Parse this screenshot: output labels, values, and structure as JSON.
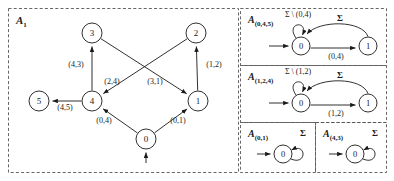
{
  "figure": {
    "background": "#ffffff",
    "stroke": "#1a1a1a",
    "dash_color": "#555555"
  },
  "panels": [
    {
      "id": "main",
      "label_base": "A",
      "label_sub": "1",
      "x": 8,
      "y": 8,
      "w": 230,
      "h": 164
    },
    {
      "id": "a045",
      "label_base": "A",
      "label_sub": "(0,4,5)",
      "x": 240,
      "y": 8,
      "w": 146,
      "h": 57
    },
    {
      "id": "a124",
      "label_base": "A",
      "label_sub": "(1,2,4)",
      "x": 240,
      "y": 65,
      "w": 146,
      "h": 57
    },
    {
      "id": "a01",
      "label_base": "A",
      "label_sub": "(0,1)",
      "x": 240,
      "y": 122,
      "w": 75,
      "h": 50
    },
    {
      "id": "a43",
      "label_base": "A",
      "label_sub": "(4,3)",
      "x": 315,
      "y": 122,
      "w": 71,
      "h": 50
    }
  ],
  "main_graph": {
    "nodes": [
      {
        "id": "n3",
        "label": "3",
        "cx": 92,
        "cy": 33,
        "r": 10
      },
      {
        "id": "n2",
        "label": "2",
        "cx": 196,
        "cy": 33,
        "r": 10
      },
      {
        "id": "n5",
        "label": "5",
        "cx": 39,
        "cy": 101,
        "r": 10
      },
      {
        "id": "n4",
        "label": "4",
        "cx": 92,
        "cy": 101,
        "r": 10
      },
      {
        "id": "n1",
        "label": "1",
        "cx": 198,
        "cy": 101,
        "r": 10
      },
      {
        "id": "n0",
        "label": "0",
        "cx": 146,
        "cy": 139,
        "r": 10
      }
    ],
    "edges": [
      {
        "from": "n4",
        "to": "n3",
        "label": "(4,3)",
        "lx": 76,
        "ly": 67
      },
      {
        "from": "n1",
        "to": "n2",
        "label": "(1,2)",
        "lx": 214,
        "ly": 67
      },
      {
        "from": "n2",
        "to": "n4",
        "label": "(2,4)",
        "lx": 112,
        "ly": 84
      },
      {
        "from": "n3",
        "to": "n1",
        "label": "(3,1)",
        "lx": 155,
        "ly": 84
      },
      {
        "from": "n4",
        "to": "n5",
        "label": "(4,5)",
        "lx": 65,
        "ly": 110
      },
      {
        "from": "n0",
        "to": "n4",
        "label": "(0,4)",
        "lx": 104,
        "ly": 123
      },
      {
        "from": "n0",
        "to": "n1",
        "label": "(0,1)",
        "lx": 178,
        "ly": 123
      }
    ],
    "start_arrow_target": "n0"
  },
  "automata": [
    {
      "id": "a045",
      "states": [
        {
          "label": "0",
          "cx": 301,
          "cy": 46,
          "r": 9
        },
        {
          "label": "1",
          "cx": 368,
          "cy": 46,
          "r": 9
        }
      ],
      "self_loop_label": "Σ \\ (0,4)",
      "self_loop_lx": 298,
      "self_loop_ly": 17,
      "forward_label": "(0,4)",
      "forward_lx": 336,
      "forward_ly": 59,
      "back_label": "Σ",
      "back_lx": 340,
      "back_ly": 21
    },
    {
      "id": "a124",
      "states": [
        {
          "label": "0",
          "cx": 301,
          "cy": 103,
          "r": 9
        },
        {
          "label": "1",
          "cx": 368,
          "cy": 103,
          "r": 9
        }
      ],
      "self_loop_label": "Σ \\ (1,2)",
      "self_loop_lx": 298,
      "self_loop_ly": 74,
      "forward_label": "(1,2)",
      "forward_lx": 336,
      "forward_ly": 116,
      "back_label": "Σ",
      "back_lx": 340,
      "back_ly": 78
    }
  ],
  "small_automata": [
    {
      "id": "a01",
      "state_label": "0",
      "cx": 283,
      "cy": 154,
      "r": 9,
      "loop_label": "Σ",
      "loop_lx": 303,
      "loop_ly": 136
    },
    {
      "id": "a43",
      "state_label": "0",
      "cx": 355,
      "cy": 154,
      "r": 9,
      "loop_label": "Σ",
      "loop_lx": 375,
      "loop_ly": 136
    }
  ]
}
